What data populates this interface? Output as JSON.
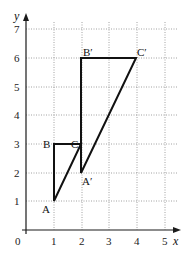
{
  "diagram": {
    "type": "coordinate-grid-transformation",
    "axes": {
      "x_label": "x",
      "y_label": "y",
      "origin_label": "0",
      "x_ticks": [
        "1",
        "2",
        "3",
        "4",
        "5"
      ],
      "y_ticks": [
        "1",
        "2",
        "3",
        "4",
        "5",
        "6",
        "7"
      ],
      "x_range": [
        0,
        5
      ],
      "y_range": [
        0,
        7
      ],
      "grid": true
    },
    "triangles": [
      {
        "name": "ABC",
        "vertices": [
          {
            "label": "A",
            "x": 1,
            "y": 1
          },
          {
            "label": "B",
            "x": 1,
            "y": 3
          },
          {
            "label": "C",
            "x": 2,
            "y": 3
          }
        ]
      },
      {
        "name": "A'B'C'",
        "vertices": [
          {
            "label": "A′",
            "x": 2,
            "y": 2
          },
          {
            "label": "B′",
            "x": 2,
            "y": 6
          },
          {
            "label": "C′",
            "x": 4,
            "y": 6
          }
        ]
      }
    ]
  }
}
